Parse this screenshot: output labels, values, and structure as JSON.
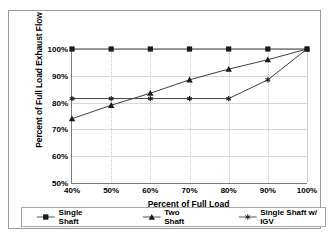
{
  "chart_data": {
    "type": "line",
    "title": "",
    "xlabel": "Percent of Full Load",
    "ylabel": "Percent of Full Load Exhaust Flow",
    "x": [
      40,
      50,
      60,
      70,
      80,
      90,
      100
    ],
    "xticklabels": [
      "40%",
      "50%",
      "60%",
      "70%",
      "80%",
      "90%",
      "100%"
    ],
    "yticklabels": [
      "50%",
      "60%",
      "70%",
      "80%",
      "90%",
      "100%"
    ],
    "yticks": [
      50,
      60,
      70,
      80,
      90,
      100
    ],
    "xlim": [
      40,
      100
    ],
    "ylim": [
      50,
      100
    ],
    "grid": true,
    "legend_position": "bottom",
    "series": [
      {
        "name": "Single Shaft",
        "marker": "square",
        "values": [
          100,
          100,
          100,
          100,
          100,
          100,
          100
        ]
      },
      {
        "name": "Two Shaft",
        "marker": "triangle",
        "values": [
          74,
          79,
          83.5,
          88.5,
          92.5,
          96,
          100
        ]
      },
      {
        "name": "Single Shaft w/ IGV",
        "marker": "star",
        "values": [
          81.5,
          81.5,
          81.5,
          81.5,
          81.5,
          88.5,
          100
        ]
      }
    ]
  },
  "colors": {
    "line": "#404040",
    "grid": "#d5d5d5",
    "axis": "#7b7b7b",
    "frame": "#9a9a9a",
    "background": "#ffffff"
  }
}
